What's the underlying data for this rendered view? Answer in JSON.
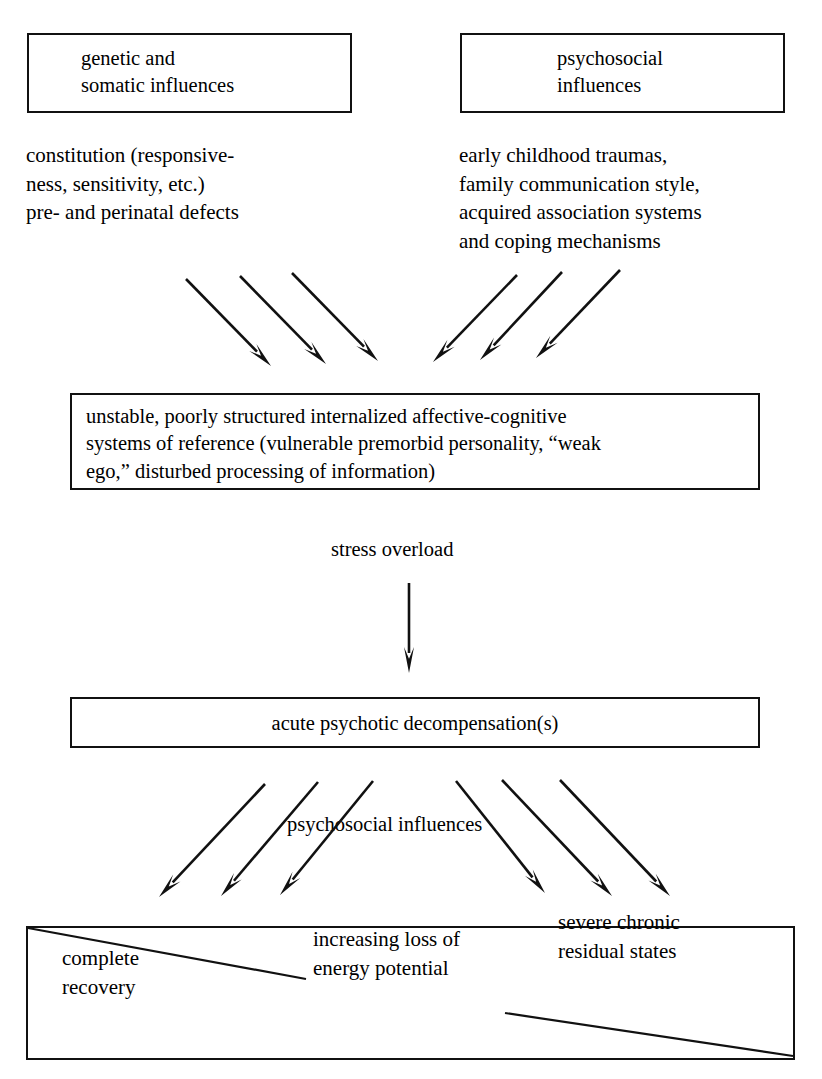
{
  "diagram": {
    "background_color": "#ffffff",
    "ink_color": "#111111"
  },
  "boxes": {
    "genetic": {
      "label": "genetic and\nsomatic influences",
      "x": 27,
      "y": 33,
      "w": 325,
      "h": 80
    },
    "psychosocial": {
      "label": "psychosocial\ninfluences",
      "x": 460,
      "y": 33,
      "w": 325,
      "h": 80
    },
    "unstable_systems": {
      "label": "unstable, poorly structured internalized affective-cognitive\nsystems of reference (vulnerable premorbid personality, “weak\nego,” disturbed processing of information)",
      "x": 70,
      "y": 393,
      "w": 690,
      "h": 97
    },
    "acute": {
      "label": "acute psychotic decompensation(s)",
      "x": 70,
      "y": 697,
      "w": 690,
      "h": 51
    },
    "outcomes": {
      "x": 26,
      "y": 926,
      "w": 769,
      "h": 134,
      "items": [
        {
          "label": "complete\nrecovery",
          "x": 62,
          "y": 944
        },
        {
          "label": "increasing loss of\nenergy potential",
          "x": 313,
          "y": 925
        },
        {
          "label": "severe chronic\nresidual states",
          "x": 558,
          "y": 908
        }
      ]
    }
  },
  "free_text": {
    "genetic_detail": {
      "label": "constitution (responsive-\nness, sensitivity, etc.)\npre- and perinatal defects",
      "x": 26,
      "y": 141
    },
    "psychosocial_detail": {
      "label": "early childhood traumas,\nfamily communication style,\nacquired association systems\nand coping mechanisms",
      "x": 459,
      "y": 141
    }
  },
  "labels": {
    "stress_overload": {
      "label": "stress overload",
      "x": 331,
      "y": 538
    },
    "psychosocial_influences_mid": {
      "label": "psychosocial influences",
      "x": 283,
      "y": 813
    }
  },
  "arrows": {
    "top_left_group": [
      {
        "x1": 186,
        "y1": 279,
        "x2": 271,
        "y2": 366
      },
      {
        "x1": 240,
        "y1": 276,
        "x2": 326,
        "y2": 364
      },
      {
        "x1": 292,
        "y1": 273,
        "x2": 378,
        "y2": 361
      }
    ],
    "top_right_group": [
      {
        "x1": 517,
        "y1": 275,
        "x2": 433,
        "y2": 362
      },
      {
        "x1": 562,
        "y1": 272,
        "x2": 480,
        "y2": 360
      },
      {
        "x1": 620,
        "y1": 270,
        "x2": 536,
        "y2": 358
      }
    ],
    "vertical": [
      {
        "x1": 409,
        "y1": 583,
        "x2": 409,
        "y2": 673
      }
    ],
    "bottom_left_group": [
      {
        "x1": 265,
        "y1": 784,
        "x2": 159,
        "y2": 897
      },
      {
        "x1": 318,
        "y1": 782,
        "x2": 221,
        "y2": 896
      },
      {
        "x1": 373,
        "y1": 781,
        "x2": 280,
        "y2": 895
      }
    ],
    "bottom_right_group": [
      {
        "x1": 456,
        "y1": 781,
        "x2": 545,
        "y2": 893
      },
      {
        "x1": 502,
        "y1": 780,
        "x2": 612,
        "y2": 896
      },
      {
        "x1": 560,
        "y1": 780,
        "x2": 670,
        "y2": 896
      }
    ]
  },
  "diagonals": [
    {
      "x1": 28,
      "y1": 928,
      "x2": 306,
      "y2": 979
    },
    {
      "x1": 505,
      "y1": 1013,
      "x2": 793,
      "y2": 1056
    }
  ]
}
